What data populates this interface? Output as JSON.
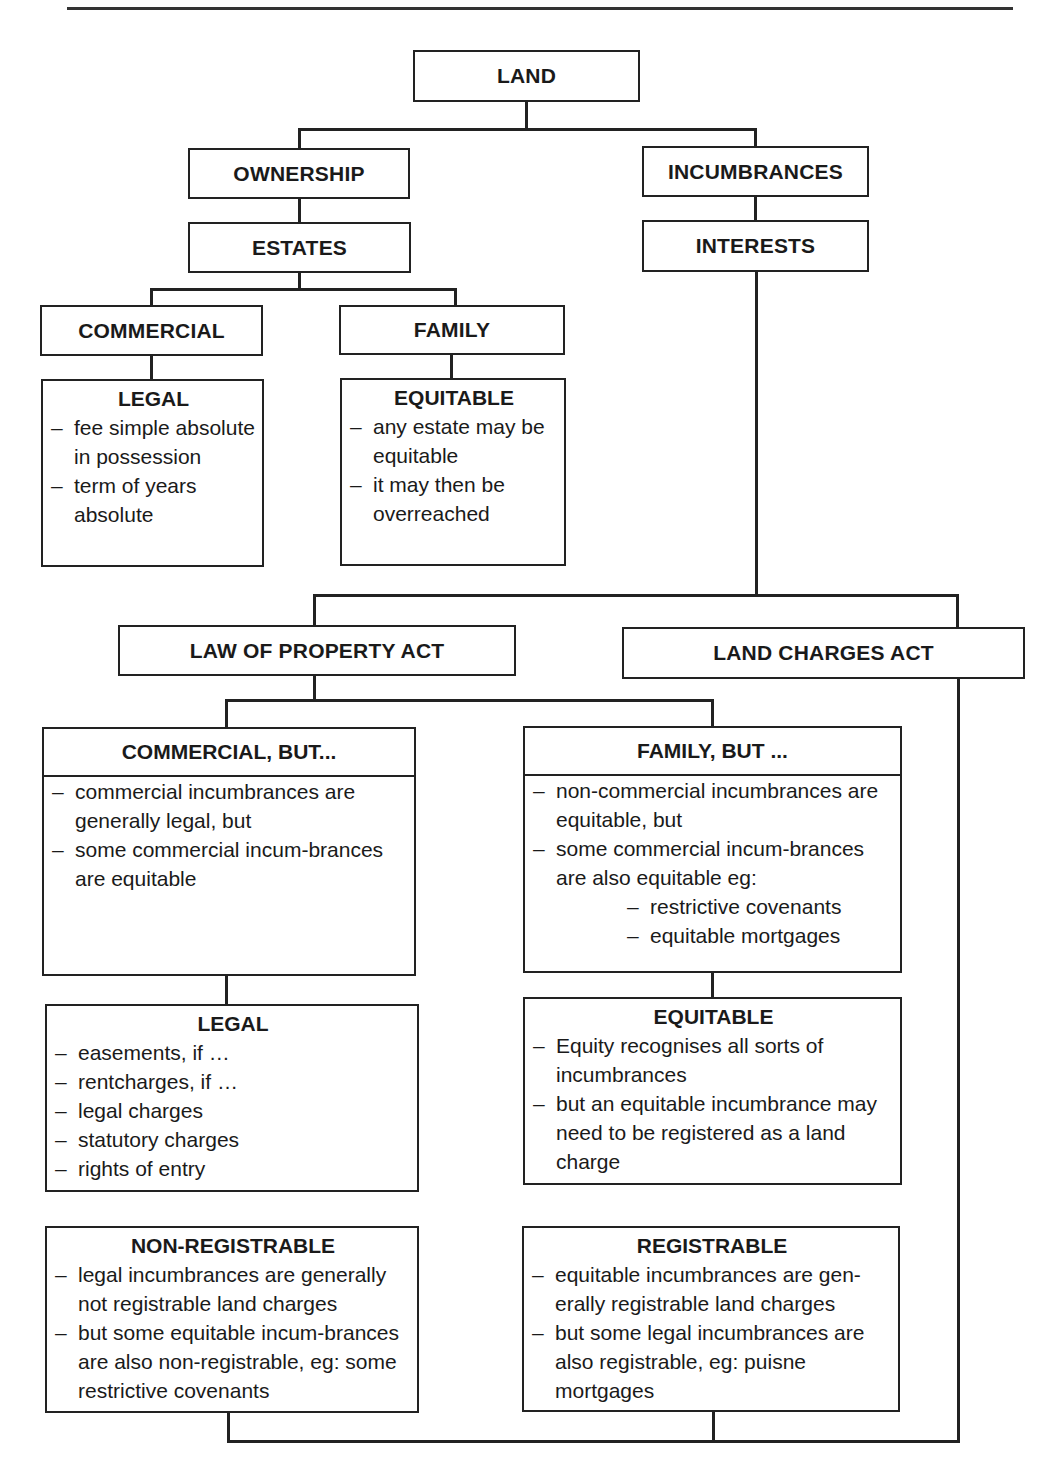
{
  "diagram": {
    "root": "LAND",
    "level1": {
      "left": "OWNERSHIP",
      "right": "INCUMBRANCES"
    },
    "level2": {
      "left": "ESTATES",
      "right": "INTERESTS"
    },
    "estates": {
      "commercial": "COMMERCIAL",
      "family": "FAMILY",
      "legal": {
        "heading": "LEGAL",
        "items": [
          "fee simple absolute in possession",
          "term of years absolute"
        ]
      },
      "equitable": {
        "heading": "EQUITABLE",
        "items": [
          "any estate may be equitable",
          "it may then be overreached"
        ]
      }
    },
    "acts": {
      "lpa": "LAW OF PROPERTY ACT",
      "lca": "LAND CHARGES ACT"
    },
    "commercial_but": {
      "heading": "COMMERCIAL, BUT...",
      "items": [
        "commercial incumbrances are generally legal, but",
        "some commercial incum-brances are equitable"
      ]
    },
    "family_but": {
      "heading": "FAMILY, BUT ...",
      "items": [
        "non-commercial incumbrances are equitable, but",
        "some commercial incum-brances are also equitable eg:"
      ],
      "sub_items": [
        "restrictive covenants",
        "equitable mortgages"
      ]
    },
    "legal_interests": {
      "heading": "LEGAL",
      "items": [
        "easements, if …",
        "rentcharges, if …",
        "legal charges",
        "statutory charges",
        "rights of entry"
      ]
    },
    "equitable_interests": {
      "heading": "EQUITABLE",
      "items": [
        "Equity recognises all sorts of incumbrances",
        "but an equitable incumbrance may need to be registered as a land charge"
      ]
    },
    "non_registrable": {
      "heading": "NON-REGISTRABLE",
      "items": [
        "legal incumbrances are generally not registrable land charges",
        "but some equitable incum-brances are also non-registrable, eg: some restrictive covenants"
      ]
    },
    "registrable": {
      "heading": "REGISTRABLE",
      "items": [
        "equitable incumbrances are gen-erally registrable land charges",
        "but some legal incumbrances are also registrable, eg: puisne mortgages"
      ]
    }
  }
}
